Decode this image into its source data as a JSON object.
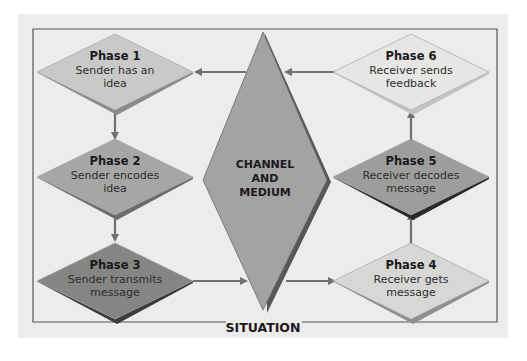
{
  "diagram": {
    "center": {
      "lines": [
        "CHANNEL",
        "AND",
        "MEDIUM"
      ],
      "fill": "#a3a3a3",
      "shadow": "#575757"
    },
    "frame_label": "SITUATION",
    "phases": [
      {
        "id": "phase-1",
        "title": "Phase 1",
        "lines": [
          "Sender has an",
          "idea"
        ],
        "fill": "#c9c9c7",
        "shadow": "#8a8a8a"
      },
      {
        "id": "phase-2",
        "title": "Phase 2",
        "lines": [
          "Sender encodes",
          "idea"
        ],
        "fill": "#a6a6a4",
        "shadow": "#6c6c6c"
      },
      {
        "id": "phase-3",
        "title": "Phase 3",
        "lines": [
          "Sender transmits",
          "message"
        ],
        "fill": "#858583",
        "shadow": "#3d3d3d"
      },
      {
        "id": "phase-4",
        "title": "Phase 4",
        "lines": [
          "Receiver gets",
          "message"
        ],
        "fill": "#d7d7d5",
        "shadow": "#8f8f8f"
      },
      {
        "id": "phase-5",
        "title": "Phase 5",
        "lines": [
          "Receiver decodes",
          "message"
        ],
        "fill": "#9d9d9b",
        "shadow": "#2a2a2a"
      },
      {
        "id": "phase-6",
        "title": "Phase 6",
        "lines": [
          "Receiver sends",
          "feedback"
        ],
        "fill": "#e6e6e4",
        "shadow": "#c3c3c1"
      }
    ],
    "colors": {
      "arrow": "#707070",
      "frame": "#555555",
      "panel": "#ececea"
    }
  }
}
